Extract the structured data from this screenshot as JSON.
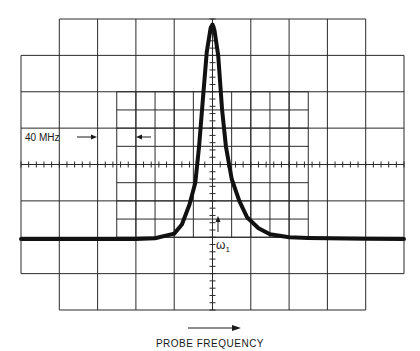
{
  "figure": {
    "title": "",
    "xlabel": "PROBE FREQUENCY",
    "annotations": {
      "bandwidth_label": "40 MHz",
      "marker_label": "ω",
      "marker_subscript": "1"
    },
    "colors": {
      "ink": "#1a1a1a",
      "background": "#ffffff"
    }
  },
  "chart_data": {
    "type": "line",
    "title": "",
    "xlabel": "PROBE FREQUENCY",
    "ylabel": "",
    "x_divisions": 10,
    "y_divisions": 8,
    "xlim": [
      -5,
      5
    ],
    "ylim": [
      -4,
      4
    ],
    "grid": true,
    "annotations": [
      "40 MHz",
      "ω1"
    ],
    "series": [
      {
        "name": "response",
        "x": [
          -5,
          -4,
          -3,
          -2,
          -1.5,
          -1.0,
          -0.8,
          -0.6,
          -0.45,
          -0.35,
          -0.25,
          -0.15,
          -0.05,
          0.0,
          0.05,
          0.15,
          0.25,
          0.35,
          0.5,
          0.7,
          0.9,
          1.2,
          1.5,
          2.0,
          2.5,
          3,
          4,
          5
        ],
        "y": [
          -2.05,
          -2.05,
          -2.05,
          -2.05,
          -2.03,
          -1.9,
          -1.65,
          -1.1,
          -0.5,
          0.5,
          1.8,
          3.1,
          3.75,
          3.85,
          3.7,
          3.0,
          1.5,
          0.5,
          -0.4,
          -1.0,
          -1.45,
          -1.75,
          -1.92,
          -2.0,
          -2.02,
          -2.03,
          -2.04,
          -2.05
        ]
      }
    ]
  }
}
